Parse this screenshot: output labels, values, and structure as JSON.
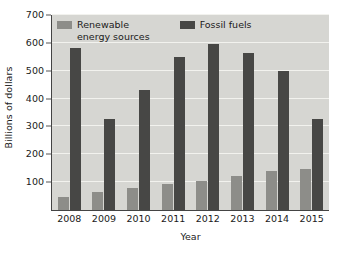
{
  "chart_data": {
    "type": "bar",
    "title": "",
    "xlabel": "Year",
    "ylabel": "Billions of dollars",
    "categories": [
      "2008",
      "2009",
      "2010",
      "2011",
      "2012",
      "2013",
      "2014",
      "2015"
    ],
    "series": [
      {
        "name": "Renewable\nenergy sources",
        "color": "#8d8d89",
        "values": [
          45,
          65,
          78,
          93,
          105,
          123,
          140,
          148
        ]
      },
      {
        "name": "Fossil fuels",
        "color": "#474745",
        "values": [
          580,
          328,
          430,
          550,
          595,
          565,
          500,
          325
        ]
      }
    ],
    "ylim": [
      0,
      700
    ],
    "ytick_labels": [
      "700",
      "600",
      "500",
      "400",
      "300",
      "200",
      "100"
    ],
    "ytick_values": [
      700,
      600,
      500,
      400,
      300,
      200,
      100
    ],
    "grid": true,
    "grid_axis": "y",
    "legend_position": "upper-left-inside",
    "plot_background": "#d6d6d2",
    "gridline_color": "#f2f2ee",
    "axis_color": "#444444",
    "text_color": "#1a1a1a"
  },
  "legend": {
    "entries": [
      {
        "label": "Renewable\nenergy sources"
      },
      {
        "label": "Fossil fuels"
      }
    ]
  }
}
